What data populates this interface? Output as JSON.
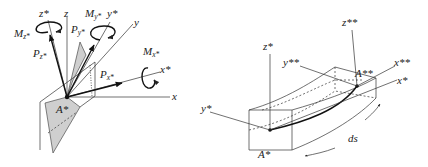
{
  "left_figure": {
    "labels": {
      "z_star": "z*",
      "z": "z",
      "y_star": "y*",
      "y": "y",
      "x_star": "x*",
      "x": "x",
      "A_star": "A*",
      "M_z": "M",
      "M_z_sub": "z*",
      "P_z": "P",
      "P_z_sub": "z*",
      "M_y": "M",
      "M_y_sub": "y*",
      "P_y": "P",
      "P_y_sub": "y*",
      "M_x": "M",
      "M_x_sub": "x*",
      "P_x": "P",
      "P_x_sub": "x*"
    }
  },
  "right_figure": {
    "labels": {
      "z_star": "z*",
      "z_star_star": "z**",
      "y_star": "y*",
      "y_star_star": "y**",
      "x_star": "x*",
      "x_star_star": "x**",
      "A_star": "A*",
      "A_star_star": "A**",
      "ds": "ds"
    }
  },
  "colors": {
    "line": "#333333",
    "shade": "#cfcfcf",
    "background": "#ffffff"
  }
}
